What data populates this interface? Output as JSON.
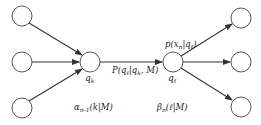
{
  "diagram": {
    "type": "trellis-transition",
    "nodes": [
      {
        "id": "left-top",
        "label": ""
      },
      {
        "id": "left-mid",
        "label": ""
      },
      {
        "id": "left-bot",
        "label": ""
      },
      {
        "id": "qk",
        "label": "q",
        "sub": "k"
      },
      {
        "id": "ql",
        "label": "q",
        "sub": "ℓ"
      },
      {
        "id": "right-top",
        "label": ""
      },
      {
        "id": "right-mid",
        "label": ""
      },
      {
        "id": "right-bot",
        "label": ""
      }
    ],
    "edges": [
      {
        "from": "left-top",
        "to": "qk"
      },
      {
        "from": "left-mid",
        "to": "qk"
      },
      {
        "from": "left-bot",
        "to": "qk"
      },
      {
        "from": "qk",
        "to": "ql",
        "label": "P(qℓ|qk, M)"
      },
      {
        "from": "ql",
        "to": "right-top"
      },
      {
        "from": "ql",
        "to": "right-mid"
      },
      {
        "from": "ql",
        "to": "right-bot"
      }
    ],
    "labels": {
      "qk_main": "q",
      "qk_sub": "k",
      "ql_main": "q",
      "ql_sub": "ℓ",
      "transition_pre": "P(q",
      "transition_sub1": "ℓ",
      "transition_mid": "|q",
      "transition_sub2": "k",
      "transition_post": ", M)",
      "emission_pre": "p(x",
      "emission_sub1": "n",
      "emission_mid": "|q",
      "emission_sub2": "ℓ",
      "emission_post": ")",
      "alpha_main": "α",
      "alpha_sub": "n-1",
      "alpha_post": "(k|M)",
      "beta_main": "β",
      "beta_sub": "n",
      "beta_post": "(ℓ|M)"
    },
    "colors": {
      "stroke": "#333333",
      "text": "#222222",
      "background": "#ffffff"
    }
  }
}
